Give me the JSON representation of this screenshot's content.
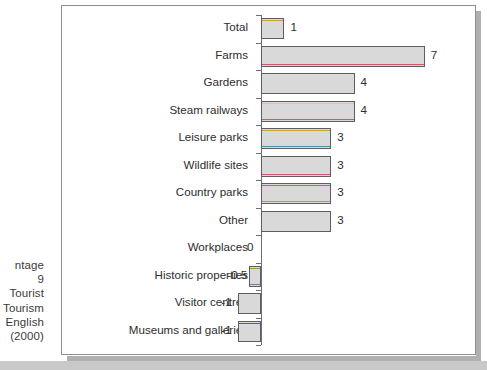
{
  "caption": {
    "lines": [
      "ntage",
      "9",
      "Tourist",
      "Tourism",
      "English",
      "(2000)"
    ]
  },
  "chart_data": {
    "type": "bar",
    "orientation": "horizontal",
    "title": "",
    "subtitle": "",
    "xlabel": "",
    "ylabel": "",
    "grid": false,
    "legend": "none",
    "xlim": [
      -1.5,
      7.6
    ],
    "zero_line": 0,
    "categories": [
      "Total",
      "Farms",
      "Gardens",
      "Steam railways",
      "Leisure parks",
      "Wildlife sites",
      "Country parks",
      "Other",
      "Workplaces",
      "Historic properties",
      "Visitor centres",
      "Museums and galleries"
    ],
    "values": [
      1,
      7,
      4,
      4,
      3,
      3,
      3,
      3,
      0,
      -0.5,
      -1,
      -1
    ],
    "value_labels": [
      "1",
      "7",
      "4",
      "4",
      "3",
      "3",
      "3",
      "3",
      "0",
      "-0.5",
      "-1",
      "-1"
    ],
    "bar_fill": "#d9d9d9",
    "bar_border": "#5d5d62",
    "accents": [
      {
        "top": "#c8a436",
        "bottom": ""
      },
      {
        "top": "",
        "bottom": "#d4576b"
      },
      {
        "top": "",
        "bottom": ""
      },
      {
        "top": "#d6cf6a",
        "bottom": "#d4576b"
      },
      {
        "top": "#c8a436",
        "bottom": "#4a8f9e"
      },
      {
        "top": "",
        "bottom": "#d4576b"
      },
      {
        "top": "#b05fb0",
        "bottom": "#5fc08a"
      },
      {
        "top": "",
        "bottom": ""
      },
      {
        "top": "",
        "bottom": ""
      },
      {
        "top": "#9a9a3a",
        "bottom": "#7a7aa8"
      },
      {
        "top": "",
        "bottom": ""
      },
      {
        "top": "#5a5aa0",
        "bottom": ""
      }
    ]
  }
}
